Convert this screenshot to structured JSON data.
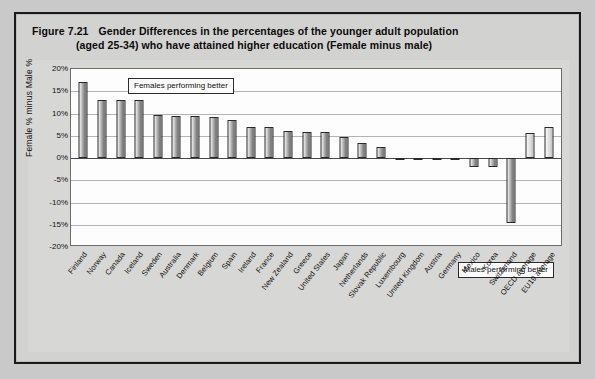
{
  "figure": {
    "number": "Figure 7.21",
    "title_line1": "Gender Differences in the percentages of the younger adult population",
    "title_line2": "(aged 25-34) who have attained higher education  (Female minus male)"
  },
  "annotations": {
    "females": "Females performing better",
    "males": "Males performing better"
  },
  "colors": {
    "frame": "#1a1a1a",
    "panel": "#d2d2d0",
    "plot_background": "#fdfdfd",
    "grid": "#b4b4b4",
    "bar_fill": "#9a9a9a",
    "bar_outline": "#2a2a2a"
  },
  "chart_data": {
    "type": "bar",
    "xlabel": "",
    "ylabel": "Female % minus Male %",
    "ylim": [
      -20,
      20
    ],
    "ytick_labels": [
      "20%",
      "15%",
      "10%",
      "5%",
      "0%",
      "-5%",
      "-10%",
      "-15%",
      "-20%"
    ],
    "ytick_values": [
      20,
      15,
      10,
      5,
      0,
      -5,
      -10,
      -15,
      -20
    ],
    "grid": true,
    "legend": "none",
    "unit": "percentage points",
    "categories": [
      "Finland",
      "Norway",
      "Canada",
      "Iceland",
      "Sweden",
      "Australia",
      "Denmark",
      "Belgium",
      "Spain",
      "Ireland",
      "France",
      "New Zealand",
      "Greece",
      "United States",
      "Japan",
      "Netherlands",
      "Slovak Republic",
      "Luxembourg",
      "United Kingdom",
      "Austria",
      "Germany",
      "Mexico",
      "Korea",
      "Switzerland",
      "OECD average",
      "EU19 average"
    ],
    "values": [
      17.0,
      13.0,
      13.0,
      13.0,
      9.6,
      9.4,
      9.4,
      9.3,
      8.6,
      7.0,
      7.0,
      6.0,
      5.9,
      5.9,
      4.8,
      3.4,
      2.4,
      0.1,
      0.1,
      0.1,
      -0.4,
      -2.0,
      -2.0,
      -14.5,
      5.7,
      6.9
    ],
    "average_categories": [
      "OECD average",
      "EU19 average"
    ],
    "annotations": [
      {
        "text": "Females performing better",
        "region": "positive"
      },
      {
        "text": "Males performing better",
        "region": "negative"
      }
    ]
  }
}
